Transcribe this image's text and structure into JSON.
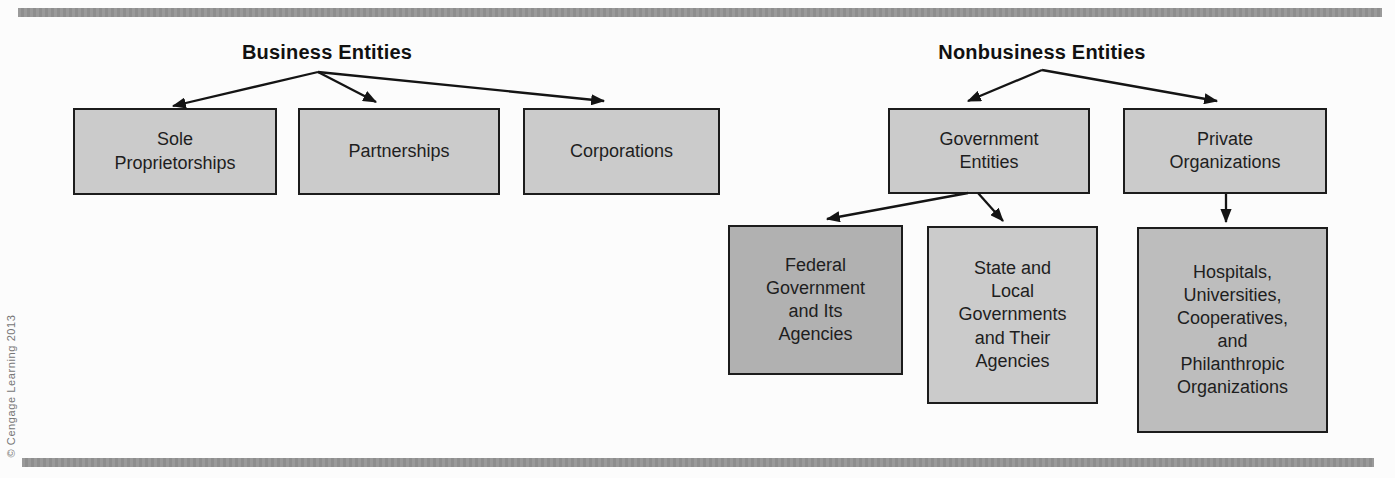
{
  "headings": {
    "business": "Business Entities",
    "nonbusiness": "Nonbusiness Entities"
  },
  "business_tree": {
    "sole_proprietorships": "Sole\nProprietorships",
    "partnerships": "Partnerships",
    "corporations": "Corporations"
  },
  "nonbusiness_tree": {
    "government_entities": "Government\nEntities",
    "private_organizations": "Private\nOrganizations",
    "federal_government": "Federal\nGovernment\nand Its\nAgencies",
    "state_local_governments": "State and\nLocal\nGovernments\nand Their\nAgencies",
    "private_org_examples": "Hospitals,\nUniversities,\nCooperatives,\nand\nPhilanthropic\nOrganizations"
  },
  "footer": {
    "credit": "© Cengage Learning 2013"
  },
  "colors": {
    "rule_bar": "#959595",
    "box_light": "#cbcbcb",
    "box_medium": "#bdbdbd",
    "box_dark": "#b1b1b1",
    "box_border": "#1c1c1c",
    "arrow": "#141414"
  }
}
